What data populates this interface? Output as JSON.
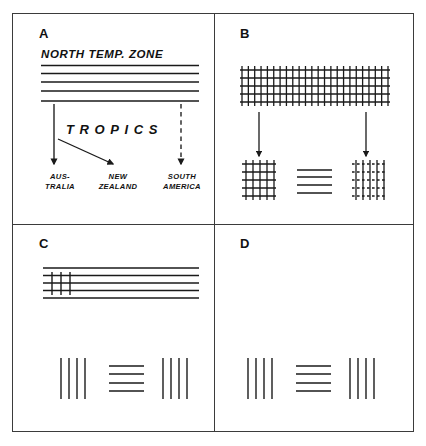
{
  "figure": {
    "background": "#ffffff",
    "ink_color": "#1a1a1a",
    "frame_color": "#3b3b3b",
    "panel_letters": [
      "A",
      "B",
      "C",
      "D"
    ]
  },
  "panel_a": {
    "letter": "A",
    "zone_label": "NORTH  TEMP.  ZONE",
    "tropics_label": "TROPICS",
    "regions": [
      {
        "name": "australia",
        "line1": "AUS-",
        "line2": "TRALIA"
      },
      {
        "name": "new-zealand",
        "line1": "NEW",
        "line2": "ZEALAND"
      },
      {
        "name": "south-america",
        "line1": "SOUTH",
        "line2": "AMERICA"
      }
    ],
    "arrows": [
      {
        "name": "arrow-to-australia",
        "style": "solid",
        "direction": "down"
      },
      {
        "name": "arrow-to-new-zealand",
        "style": "solid",
        "direction": "diagonal-down-right"
      },
      {
        "name": "arrow-to-south-america",
        "style": "dashed",
        "direction": "down"
      }
    ],
    "band_line_count": 5
  },
  "panel_b": {
    "letter": "B",
    "source_grid": {
      "name": "large-grid",
      "horizontal_lines": 5,
      "vertical_lines": 24,
      "line_style": "solid"
    },
    "arrows": [
      {
        "name": "arrow-left-descendant",
        "style": "solid",
        "direction": "down"
      },
      {
        "name": "arrow-right-descendant",
        "style": "solid",
        "direction": "down"
      }
    ],
    "results": [
      {
        "name": "grid-solid-left",
        "horizontal_lines": 5,
        "vertical_lines": 5,
        "horizontal_style": "solid",
        "vertical_style": "solid"
      },
      {
        "name": "horizontal-only-middle",
        "horizontal_lines": 4,
        "vertical_lines": 0,
        "horizontal_style": "solid",
        "vertical_style": "none"
      },
      {
        "name": "grid-dashed-right",
        "horizontal_lines": 5,
        "vertical_lines": 5,
        "horizontal_style": "dashed",
        "vertical_style": "solid"
      }
    ]
  },
  "panel_c": {
    "letter": "C",
    "band": {
      "name": "horizontal-band",
      "horizontal_lines": 5,
      "short_vertical_lines": 3
    },
    "results": [
      {
        "name": "vertical-only-left",
        "vertical_lines": 4,
        "horizontal_lines": 0
      },
      {
        "name": "horizontal-only-middle",
        "vertical_lines": 0,
        "horizontal_lines": 4
      },
      {
        "name": "vertical-only-right",
        "vertical_lines": 4,
        "horizontal_lines": 0
      }
    ]
  },
  "panel_d": {
    "letter": "D",
    "band": null,
    "results": [
      {
        "name": "vertical-only-left",
        "vertical_lines": 4,
        "horizontal_lines": 0
      },
      {
        "name": "horizontal-only-middle",
        "vertical_lines": 0,
        "horizontal_lines": 4
      },
      {
        "name": "vertical-only-right",
        "vertical_lines": 4,
        "horizontal_lines": 0
      }
    ]
  }
}
